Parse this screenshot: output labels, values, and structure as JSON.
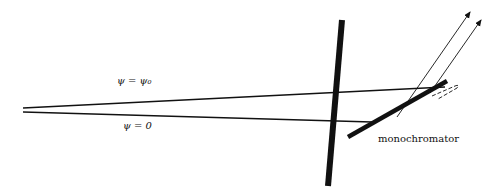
{
  "labels": {
    "psi_top": "ψ = ψ₀",
    "psi_bottom": "ψ = 0",
    "monochromator": "monochromator"
  },
  "colors": {
    "ink": "#111111",
    "background": "#ffffff"
  }
}
